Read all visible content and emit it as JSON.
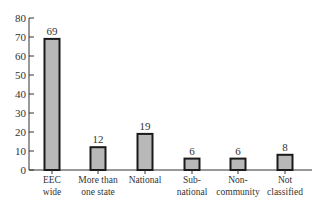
{
  "chart_data": {
    "type": "bar",
    "title": "",
    "xlabel": "",
    "ylabel": "",
    "ylim": [
      0,
      80
    ],
    "yticks": [
      0,
      10,
      20,
      30,
      40,
      50,
      60,
      70,
      80
    ],
    "grid": false,
    "legend": null,
    "categories": [
      [
        "EEC",
        "wide"
      ],
      [
        "More than",
        "one state"
      ],
      [
        "National"
      ],
      [
        "Sub-",
        "national"
      ],
      [
        "Non-",
        "community"
      ],
      [
        "Not",
        "classified"
      ]
    ],
    "category_names": [
      "EEC wide",
      "More than one state",
      "National",
      "Sub-national",
      "Non-community",
      "Not classified"
    ],
    "values": [
      69,
      12,
      19,
      6,
      6,
      8
    ],
    "bar_fill": "#b8b8b8",
    "bar_stroke": "#1a1a1a"
  }
}
